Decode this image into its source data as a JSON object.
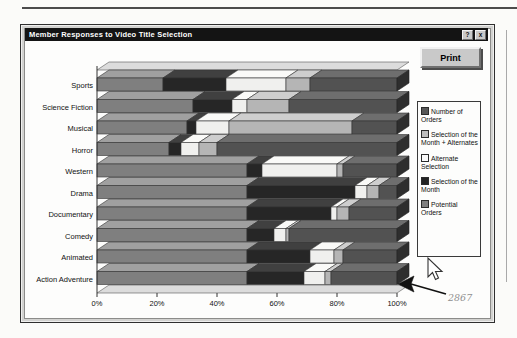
{
  "window": {
    "title": "Member Responses to Video Title Selection",
    "help_label": "?",
    "close_label": "x"
  },
  "toolbar": {
    "print_label": "Print"
  },
  "legend": {
    "items": [
      {
        "label": "Number of Orders",
        "color": "#565656"
      },
      {
        "label": "Selection of the Month + Alternates",
        "color": "#bdbdbd"
      },
      {
        "label": "Alternate Selection",
        "color": "#fafafa"
      },
      {
        "label": "Selection of the Month",
        "color": "#232323"
      },
      {
        "label": "Potential Orders",
        "color": "#7f7f7f"
      }
    ]
  },
  "annotation": {
    "value": "2867"
  },
  "chart_data": {
    "type": "bar",
    "orientation": "horizontal",
    "stacked_percent": true,
    "categories": [
      "Sports",
      "Science Fiction",
      "Musical",
      "Horror",
      "Western",
      "Drama",
      "Documentary",
      "Comedy",
      "Animated",
      "Action Adventure"
    ],
    "series": [
      {
        "name": "Potential Orders",
        "front": "#7f7f7f",
        "top": "#a0a0a0",
        "values": [
          22,
          32,
          30,
          24,
          50,
          50,
          50,
          50,
          50,
          50
        ]
      },
      {
        "name": "Selection of the Month",
        "front": "#262626",
        "top": "#404040",
        "values": [
          21,
          13,
          3,
          4,
          5,
          36,
          28,
          9,
          21,
          19
        ]
      },
      {
        "name": "Alternate Selection",
        "front": "#f0f0ee",
        "top": "#fafaf8",
        "values": [
          20,
          5,
          11,
          6,
          25,
          4,
          2,
          4,
          8,
          7
        ]
      },
      {
        "name": "Selection of the Month + Alternates",
        "front": "#b5b5b5",
        "top": "#cecece",
        "values": [
          8,
          14,
          41,
          6,
          2,
          4,
          4,
          1,
          3,
          2
        ]
      },
      {
        "name": "Number of Orders",
        "front": "#525252",
        "top": "#6e6e6e",
        "values": [
          29,
          36,
          15,
          60,
          18,
          6,
          16,
          36,
          18,
          22
        ]
      }
    ],
    "x_ticks": [
      "0%",
      "20%",
      "40%",
      "60%",
      "80%",
      "100%"
    ],
    "xlim": [
      0,
      100
    ],
    "endcap_color": "#2e2e2e",
    "wall_color": "#dcdcdc"
  }
}
